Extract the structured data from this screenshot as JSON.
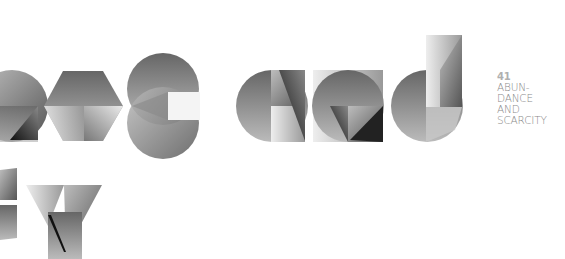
{
  "caption": {
    "number": "41",
    "lines": [
      "ABUN-",
      "DANCE",
      "AND",
      "SCARCITY"
    ]
  },
  "artwork": {
    "description": "Geometric grayscale lettering fragments",
    "row1_letters": [
      "a",
      "c",
      "e",
      "a",
      "a",
      "d"
    ],
    "row2_letters": [
      "s",
      "y"
    ]
  },
  "colors": {
    "background": "#ffffff",
    "text": "#8a8a8a",
    "number": "#b0b0b0"
  }
}
